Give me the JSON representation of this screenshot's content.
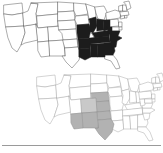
{
  "figure": {
    "title": "",
    "width": 163,
    "height": 153,
    "background": "#ffffff",
    "footer_rule": {
      "y": 145,
      "color": "#9a9a9a"
    }
  },
  "chart_data": {
    "type": "map",
    "title": "",
    "subtitle": "",
    "xlabel": "",
    "ylabel": "",
    "legend": [],
    "annotations": [],
    "grid": false,
    "projection": "albers-usa-simplified",
    "panels": [
      {
        "id": "top-map",
        "label": "",
        "position": {
          "x": 2,
          "y": 2,
          "width": 128,
          "height": 70
        },
        "highlight_color": "#1c1c1c",
        "base_color": "#ffffff",
        "outline_color": "#5a5a5a",
        "highlighted_states": [
          "MO",
          "IL",
          "IN",
          "OH",
          "KY",
          "TN",
          "AR",
          "LA",
          "MS",
          "AL",
          "GA",
          "WV",
          "VA",
          "NC",
          "SC"
        ],
        "unhighlighted_states": [
          "WA",
          "OR",
          "CA",
          "NV",
          "ID",
          "MT",
          "WY",
          "UT",
          "AZ",
          "CO",
          "NM",
          "ND",
          "SD",
          "NE",
          "KS",
          "OK",
          "TX",
          "MN",
          "IA",
          "WI",
          "MI",
          "FL",
          "PA",
          "NY",
          "NJ",
          "DE",
          "MD",
          "CT",
          "RI",
          "MA",
          "VT",
          "NH",
          "ME"
        ]
      },
      {
        "id": "bottom-map",
        "label": "",
        "position": {
          "x": 35,
          "y": 72,
          "width": 126,
          "height": 70
        },
        "highlight_color": "#b2b2b2",
        "base_color": "#ffffff",
        "outline_color": "#a8a8a8",
        "highlighted_states": [
          "NE",
          "KS",
          "OK",
          "TX",
          "NM",
          "AZ",
          "CO"
        ],
        "unhighlighted_states": [
          "WA",
          "OR",
          "CA",
          "NV",
          "ID",
          "MT",
          "WY",
          "UT",
          "ND",
          "SD",
          "MN",
          "IA",
          "MO",
          "AR",
          "LA",
          "WI",
          "IL",
          "MI",
          "IN",
          "OH",
          "KY",
          "TN",
          "MS",
          "AL",
          "GA",
          "FL",
          "SC",
          "NC",
          "VA",
          "WV",
          "PA",
          "NY",
          "NJ",
          "DE",
          "MD",
          "CT",
          "RI",
          "MA",
          "VT",
          "NH",
          "ME"
        ]
      }
    ]
  },
  "accessibility": {
    "top_map_description": "United States map with Midwest and Southeast states filled dark",
    "bottom_map_description": "United States map with Great Plains and Southwest states filled gray"
  }
}
